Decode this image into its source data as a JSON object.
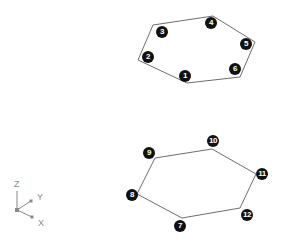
{
  "colors": {
    "outline": "#6e6e6e",
    "badge_fill": "#111111",
    "badge_text": "#ffffff",
    "axis": "#8a8a8a",
    "background": "#ffffff"
  },
  "shapes": [
    {
      "name": "upper-hexagon",
      "vertices": [
        [
          153,
          25
        ],
        [
          213,
          16
        ],
        [
          255,
          42
        ],
        [
          240,
          77
        ],
        [
          187,
          83
        ],
        [
          138,
          60
        ]
      ],
      "labels": [
        {
          "text": "1",
          "x": 185,
          "y": 76
        },
        {
          "text": "2",
          "x": 148,
          "y": 57
        },
        {
          "text": "3",
          "x": 162,
          "y": 32
        },
        {
          "text": "4",
          "x": 211,
          "y": 23
        },
        {
          "text": "5",
          "x": 246,
          "y": 44
        },
        {
          "text": "6",
          "x": 235,
          "y": 69
        }
      ]
    },
    {
      "name": "lower-hexagon",
      "vertices": [
        [
          155,
          158
        ],
        [
          212,
          149
        ],
        [
          256,
          174
        ],
        [
          240,
          208
        ],
        [
          182,
          218
        ],
        [
          137,
          194
        ]
      ],
      "labels": [
        {
          "text": "7",
          "x": 180,
          "y": 226
        },
        {
          "text": "8",
          "x": 132,
          "y": 195
        },
        {
          "text": "9",
          "x": 149,
          "y": 153
        },
        {
          "text": "10",
          "x": 213,
          "y": 141
        },
        {
          "text": "11",
          "x": 262,
          "y": 174
        },
        {
          "text": "12",
          "x": 247,
          "y": 215
        }
      ]
    }
  ],
  "axis_icon": {
    "origin": [
      17,
      210
    ],
    "z": {
      "label": "Z",
      "end": [
        17,
        191
      ],
      "label_pos": [
        14,
        180
      ]
    },
    "y": {
      "label": "Y",
      "end": [
        31,
        201
      ],
      "label_pos": [
        37,
        193
      ]
    },
    "x": {
      "label": "X",
      "end": [
        32,
        217
      ],
      "label_pos": [
        38,
        219
      ]
    }
  }
}
